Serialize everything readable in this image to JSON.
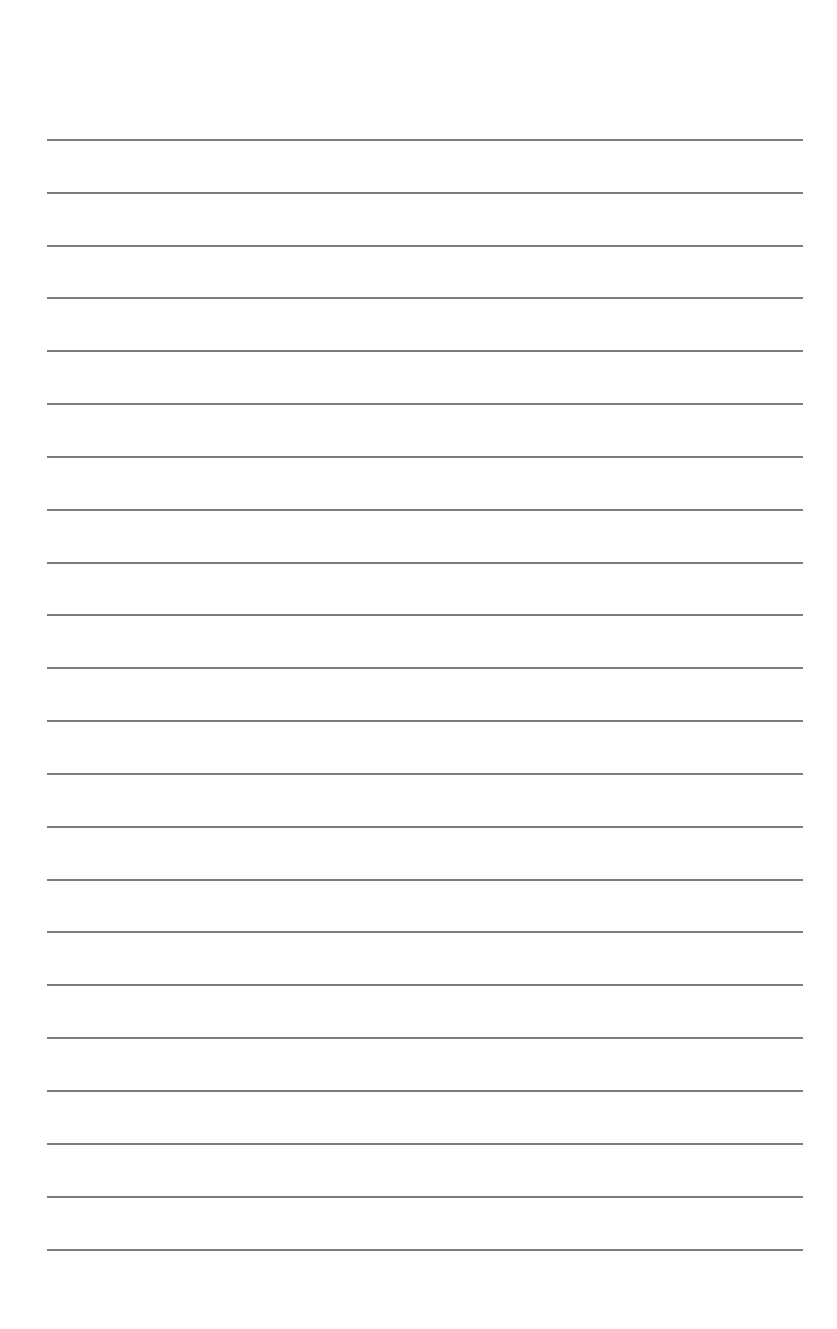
{
  "page": {
    "type": "lined-paper",
    "background_color": "#ffffff",
    "rule_color": "#7c7c7c",
    "rule_left": 47,
    "rule_right": 803,
    "rule_count": 22,
    "rule_y_positions": [
      139,
      192,
      245,
      297,
      350,
      403,
      456,
      509,
      562,
      614,
      667,
      720,
      773,
      826,
      879,
      931,
      984,
      1037,
      1090,
      1143,
      1196,
      1249
    ]
  }
}
